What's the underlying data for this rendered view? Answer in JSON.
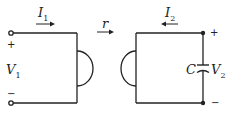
{
  "diagram": {
    "type": "two-port circuit with coupling element",
    "left_port": {
      "current_label": "I",
      "current_sub": "1",
      "current_direction": "right",
      "voltage_label": "V",
      "voltage_sub": "1",
      "plus": "+",
      "minus": "−"
    },
    "coupling": {
      "label": "r",
      "direction": "right"
    },
    "right_port": {
      "current_label": "I",
      "current_sub": "2",
      "current_direction": "left",
      "capacitor_label": "C",
      "voltage_label": "V",
      "voltage_sub": "2",
      "plus": "+",
      "minus": "−"
    },
    "colors": {
      "line": "#222222",
      "background": "#ffffff"
    }
  }
}
